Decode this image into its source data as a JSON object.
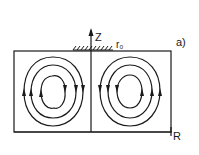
{
  "figure": {
    "panel_label": "a)",
    "axis_vertical_label": "Z",
    "axis_horizontal_label": "R",
    "surface_label": "r₀",
    "ink_color": "#1a1a1a",
    "background_color": "#ffffff"
  },
  "vortices": [
    {
      "name": "left-vortex-cell",
      "rings": 3,
      "circulation": "counterclockwise"
    },
    {
      "name": "right-vortex-cell",
      "rings": 3,
      "circulation": "clockwise"
    }
  ]
}
